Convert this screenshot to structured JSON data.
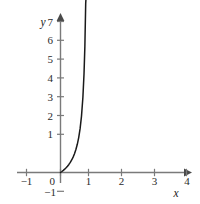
{
  "chart_data": {
    "type": "line",
    "title": "",
    "subtitle": "",
    "xlabel": "x",
    "ylabel": "y",
    "xlim": [
      -1,
      4
    ],
    "ylim": [
      -1,
      7
    ],
    "grid": false,
    "legend": null,
    "x_ticks": [
      -1,
      0,
      1,
      2,
      3,
      4
    ],
    "x_tick_labels": [
      "−1",
      "0",
      "1",
      "2",
      "3",
      "4"
    ],
    "y_ticks": [
      -1,
      0,
      1,
      2,
      3,
      4,
      5,
      6,
      7
    ],
    "y_tick_labels": [
      "−1",
      "0",
      "1",
      "2",
      "3",
      "4",
      "5",
      "6",
      "7"
    ],
    "series": [
      {
        "name": "curve",
        "color": "#1a1a1a",
        "asymptote_x": 1,
        "x": [
          0.0,
          0.05,
          0.1,
          0.15,
          0.2,
          0.25,
          0.3,
          0.35,
          0.4,
          0.45,
          0.5,
          0.55,
          0.6,
          0.65,
          0.7,
          0.75,
          0.8,
          0.84,
          0.87,
          0.9,
          0.92,
          0.94,
          0.95,
          0.96,
          0.965,
          0.97,
          0.972
        ],
        "y": [
          0.0,
          0.053,
          0.111,
          0.176,
          0.25,
          0.333,
          0.429,
          0.538,
          0.667,
          0.818,
          1.0,
          1.222,
          1.5,
          1.857,
          2.333,
          3.0,
          4.0,
          5.25,
          6.69,
          9.0,
          11.5,
          15.67,
          19.0,
          24.0,
          27.57,
          32.33,
          34.7
        ]
      }
    ],
    "axis_color": "#7a7a7a",
    "curve_color": "#1a1a1a",
    "background": "#ffffff",
    "x_axis_label_text": "x",
    "y_axis_label_text": "y"
  },
  "labels": {
    "y_axis_name": "y",
    "x_axis_name": "x",
    "y7": "7",
    "y6": "6",
    "y5": "5",
    "y4": "4",
    "y3": "3",
    "y2": "2",
    "y1": "1",
    "y0": "0",
    "yneg1": "−1",
    "xneg1": "−1",
    "x1": "1",
    "x2": "2",
    "x3": "3",
    "x4": "4"
  }
}
